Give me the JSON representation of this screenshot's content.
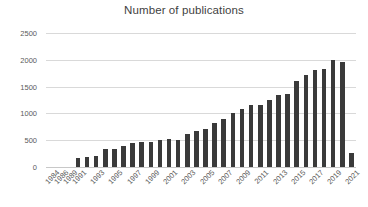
{
  "chart_data": {
    "type": "bar",
    "title": "Number of publications",
    "xlabel": "",
    "ylabel": "",
    "ylim": [
      0,
      2500
    ],
    "ytick_values": [
      0,
      500,
      1000,
      1500,
      2000,
      2500
    ],
    "ytick_labels": [
      "0",
      "500",
      "1000",
      "1500",
      "2000",
      "2500"
    ],
    "grid": "horizontal",
    "legend": "none",
    "bar_color": "#3a3a3a",
    "gridline_color": "#d9d9d9",
    "categories": [
      "1984",
      "1986",
      "1989",
      "1991",
      "1992",
      "1993",
      "1994",
      "1995",
      "1996",
      "1997",
      "1998",
      "1999",
      "2000",
      "2001",
      "2002",
      "2003",
      "2004",
      "2005",
      "2006",
      "2007",
      "2008",
      "2009",
      "2010",
      "2011",
      "2012",
      "2013",
      "2014",
      "2015",
      "2016",
      "2017",
      "2018",
      "2019",
      "2020",
      "2021"
    ],
    "visible_xtick_labels": [
      "1984",
      "1986",
      "1989",
      "1991",
      "1993",
      "1995",
      "1997",
      "1999",
      "2001",
      "2003",
      "2005",
      "2007",
      "2009",
      "2011",
      "2013",
      "2015",
      "2017",
      "2019",
      "2021"
    ],
    "values": [
      0,
      0,
      0,
      175,
      180,
      200,
      330,
      330,
      390,
      455,
      470,
      475,
      510,
      515,
      500,
      615,
      665,
      700,
      820,
      895,
      1010,
      1075,
      1150,
      1165,
      1255,
      1340,
      1365,
      1610,
      1715,
      1810,
      1825,
      2000,
      1955,
      270
    ]
  }
}
